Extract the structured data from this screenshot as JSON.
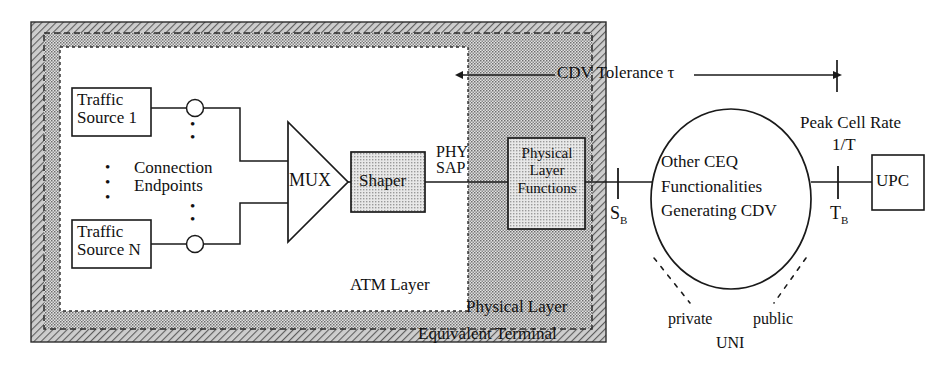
{
  "diagram": {
    "colors": {
      "outer_hatch": "#8f8f8f",
      "phy_hatch": "#b3b3b3",
      "box_fill": "#cfcfcf",
      "line": "#1a1a1a",
      "paper": "#ffffff"
    }
  },
  "regions": {
    "equivalent_terminal": {
      "label": "Equivalent Terminal"
    },
    "physical_layer": {
      "label": "Physical Layer"
    },
    "atm_layer": {
      "label": "ATM Layer"
    }
  },
  "blocks": {
    "traffic_source_1": {
      "line1": "Traffic",
      "line2": "Source 1"
    },
    "traffic_source_n": {
      "line1": "Traffic",
      "line2": "Source N"
    },
    "mux": {
      "label": "MUX"
    },
    "shaper": {
      "label": "Shaper"
    },
    "physical_layer_functions": {
      "line1": "Physical",
      "line2": "Layer",
      "line3": "Functions"
    },
    "upc": {
      "label": "UPC"
    }
  },
  "ellipse": {
    "line1": "Other CEQ",
    "line2": "Functionalities",
    "line3": "Generating CDV"
  },
  "labels": {
    "connection_endpoints": {
      "line1": "Connection",
      "line2": "Endpoints"
    },
    "phy_sap": {
      "line1": "PHY",
      "line2": "SAP"
    },
    "cdv_tolerance": "CDV Tolerance τ",
    "peak_cell_rate": "Peak Cell Rate",
    "peak_cell_rate_value": "1/T",
    "sb_marker": "S",
    "sb_subscript": "B",
    "tb_marker": "T",
    "tb_subscript": "B",
    "private": "private",
    "public": "public",
    "uni": "UNI",
    "vertical_dots": "•"
  }
}
